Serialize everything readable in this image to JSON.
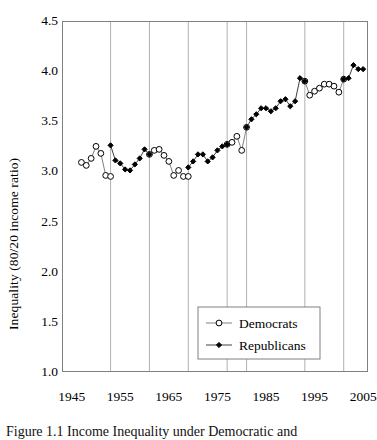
{
  "figure": {
    "caption": "Figure 1.1 Income Inequality under Democratic and",
    "background": "#ffffff"
  },
  "chart_data": {
    "type": "line",
    "title": "",
    "subtitle": "",
    "xlabel": "",
    "ylabel": "Inequality (80/20 income ratio)",
    "xlim": [
      1943,
      2006
    ],
    "ylim": [
      1.0,
      4.5
    ],
    "yticks": [
      "1.0",
      "1.5",
      "2.0",
      "2.5",
      "3.0",
      "3.5",
      "4.0",
      "4.5"
    ],
    "ytick_values": [
      1.0,
      1.5,
      2.0,
      2.5,
      3.0,
      3.5,
      4.0,
      4.5
    ],
    "xticks": [
      "1945",
      "1955",
      "1965",
      "1975",
      "1985",
      "1995",
      "2005"
    ],
    "xtick_values": [
      1945,
      1955,
      1965,
      1975,
      1985,
      1995,
      2005
    ],
    "xminor_step": 5,
    "grid": "vertical-only-at-party-transitions",
    "gridline_years": [
      1953,
      1961,
      1969,
      1977,
      1981,
      1993,
      2001
    ],
    "gridline_color": "#b0b0b0",
    "axis_color": "#808080",
    "legend_position": "bottom-center",
    "series": [
      {
        "name": "Democrats",
        "marker": "open-circle",
        "marker_fill": "#ffffff",
        "marker_edge": "#000000",
        "line_color": "#808080",
        "points": [
          [
            1947,
            3.09
          ],
          [
            1948,
            3.06
          ],
          [
            1949,
            3.13
          ],
          [
            1950,
            3.25
          ],
          [
            1951,
            3.18
          ],
          [
            1952,
            2.96
          ],
          [
            1953,
            2.95
          ],
          [
            1961,
            3.17
          ],
          [
            1962,
            3.21
          ],
          [
            1963,
            3.22
          ],
          [
            1964,
            3.16
          ],
          [
            1965,
            3.1
          ],
          [
            1966,
            2.96
          ],
          [
            1967,
            3.01
          ],
          [
            1968,
            2.95
          ],
          [
            1969,
            2.95
          ],
          [
            1977,
            3.27
          ],
          [
            1978,
            3.29
          ],
          [
            1979,
            3.35
          ],
          [
            1980,
            3.21
          ],
          [
            1981,
            3.44
          ],
          [
            1993,
            3.9
          ],
          [
            1994,
            3.76
          ],
          [
            1995,
            3.8
          ],
          [
            1996,
            3.83
          ],
          [
            1997,
            3.87
          ],
          [
            1998,
            3.87
          ],
          [
            1999,
            3.85
          ],
          [
            2000,
            3.79
          ],
          [
            2001,
            3.92
          ]
        ]
      },
      {
        "name": "Republicans",
        "marker": "filled-diamond",
        "marker_fill": "#000000",
        "marker_edge": "#000000",
        "line_color": "#404040",
        "points": [
          [
            1953,
            3.26
          ],
          [
            1954,
            3.11
          ],
          [
            1955,
            3.08
          ],
          [
            1956,
            3.02
          ],
          [
            1957,
            3.01
          ],
          [
            1958,
            3.07
          ],
          [
            1959,
            3.13
          ],
          [
            1960,
            3.22
          ],
          [
            1961,
            3.17
          ],
          [
            1969,
            3.04
          ],
          [
            1970,
            3.1
          ],
          [
            1971,
            3.17
          ],
          [
            1972,
            3.17
          ],
          [
            1973,
            3.1
          ],
          [
            1974,
            3.14
          ],
          [
            1975,
            3.21
          ],
          [
            1976,
            3.25
          ],
          [
            1977,
            3.27
          ],
          [
            1981,
            3.44
          ],
          [
            1982,
            3.52
          ],
          [
            1983,
            3.57
          ],
          [
            1984,
            3.63
          ],
          [
            1985,
            3.63
          ],
          [
            1986,
            3.6
          ],
          [
            1987,
            3.63
          ],
          [
            1988,
            3.7
          ],
          [
            1989,
            3.72
          ],
          [
            1990,
            3.65
          ],
          [
            1991,
            3.7
          ],
          [
            1992,
            3.93
          ],
          [
            1993,
            3.9
          ],
          [
            2001,
            3.92
          ],
          [
            2002,
            3.93
          ],
          [
            2003,
            4.06
          ],
          [
            2004,
            4.02
          ],
          [
            2005,
            4.02
          ]
        ]
      }
    ],
    "legend": [
      {
        "label": "Democrats",
        "marker": "open-circle"
      },
      {
        "label": "Republicans",
        "marker": "filled-diamond"
      }
    ]
  }
}
